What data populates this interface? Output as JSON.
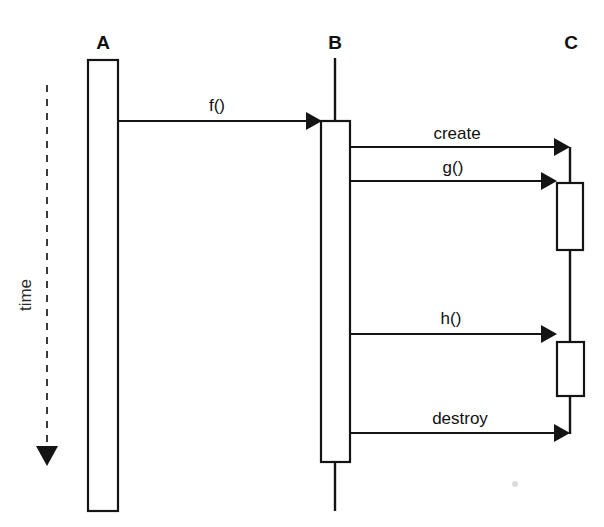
{
  "diagram": {
    "type": "uml-sequence-diagram",
    "canvas": {
      "width": 604,
      "height": 527,
      "background": "#ffffff"
    },
    "ink_color": "#141414",
    "time_axis": {
      "label": "time",
      "orientation": "vertical-downward",
      "style": "dashed-arrow",
      "x": 47,
      "y_start": 85,
      "y_end": 463,
      "label_x": 30,
      "label_y": 295
    },
    "lifelines": [
      {
        "id": "A",
        "label": "A",
        "label_x": 103,
        "label_y": 49,
        "axis_x": 103,
        "line_segments": [],
        "activations": [
          {
            "x": 88,
            "y": 60,
            "width": 30,
            "height": 451
          }
        ]
      },
      {
        "id": "B",
        "label": "B",
        "label_x": 335,
        "label_y": 49,
        "axis_x": 335,
        "line_segments": [
          {
            "x": 335,
            "y1": 58,
            "y2": 121
          },
          {
            "x": 335,
            "y1": 462,
            "y2": 511
          }
        ],
        "activations": [
          {
            "x": 321,
            "y": 121,
            "width": 29,
            "height": 341
          }
        ]
      },
      {
        "id": "C",
        "label": "C",
        "label_x": 571,
        "label_y": 49,
        "axis_x": 570,
        "line_segments": [
          {
            "x": 570,
            "y1": 147,
            "y2": 183
          },
          {
            "x": 570,
            "y1": 250,
            "y2": 342
          },
          {
            "x": 570,
            "y1": 396,
            "y2": 433
          }
        ],
        "activations": [
          {
            "x": 557,
            "y": 183,
            "width": 26,
            "height": 67
          },
          {
            "x": 557,
            "y": 342,
            "width": 27,
            "height": 54
          }
        ]
      }
    ],
    "messages": [
      {
        "label": "f()",
        "from": "A",
        "to": "B",
        "x_start": 118,
        "x_end": 321,
        "y": 121,
        "label_x": 217,
        "label_y": 111,
        "arrow": "filled-solid"
      },
      {
        "label": "create",
        "from": "B",
        "to": "C",
        "x_start": 350,
        "x_end": 570,
        "y": 147,
        "label_x": 457,
        "label_y": 139,
        "arrow": "filled-solid"
      },
      {
        "label": "g()",
        "from": "B",
        "to": "C",
        "x_start": 350,
        "x_end": 557,
        "y": 181,
        "label_x": 453,
        "label_y": 173,
        "arrow": "filled-solid"
      },
      {
        "label": "h()",
        "from": "B",
        "to": "C",
        "x_start": 350,
        "x_end": 557,
        "y": 334,
        "label_x": 451,
        "label_y": 324,
        "arrow": "filled-solid"
      },
      {
        "label": "destroy",
        "from": "B",
        "to": "C",
        "x_start": 350,
        "x_end": 570,
        "y": 433,
        "label_x": 460,
        "label_y": 424,
        "arrow": "filled-solid"
      }
    ],
    "artifacts": [
      {
        "name": "scan-speck",
        "x": 515,
        "y": 484,
        "r": 3
      }
    ]
  }
}
